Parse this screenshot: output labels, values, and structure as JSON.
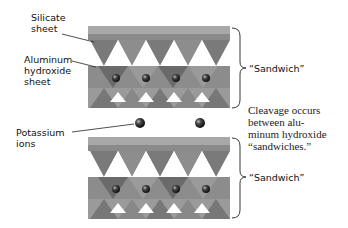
{
  "labels": {
    "silicate_sheet": [
      "Silicate",
      "sheet"
    ],
    "aluminum_hydroxide_sheet": [
      "Aluminum",
      "hydroxide",
      "sheet"
    ],
    "potassium_ions": [
      "Potassium",
      "ions"
    ],
    "sandwich_top": "“Sandwich”",
    "sandwich_bottom": "“Sandwich”",
    "cleavage_note": [
      "Cleavage occurs",
      "between alu-",
      "minum hydroxide",
      "“sandwiches.”"
    ]
  },
  "colors": {
    "tetra_light": "#b4b4b4",
    "tetra_mid": "#8e8e8e",
    "tetra_dark": "#5e5e5e",
    "ion": "#222222",
    "text": "#111111"
  }
}
